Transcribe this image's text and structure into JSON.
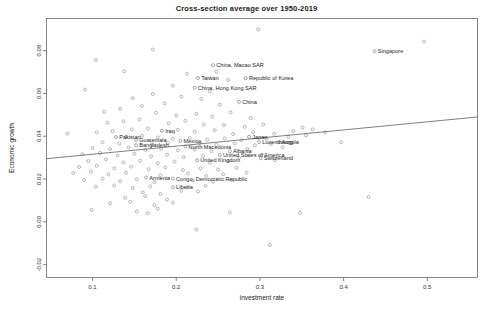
{
  "chart_data": {
    "type": "scatter",
    "title": "Cross-section average over 1950-2019",
    "xlabel": "investment rate",
    "ylabel": "Economic growth",
    "xlim": [
      0.045,
      0.56
    ],
    "ylim": [
      -0.026,
      0.095
    ],
    "xticks": [
      0.1,
      0.2,
      0.3,
      0.4,
      0.5
    ],
    "xtick_labels": [
      "0.1",
      "0.2",
      "0.3",
      "0.4",
      "0.5"
    ],
    "yticks": [
      -0.02,
      0.0,
      0.02,
      0.04,
      0.06,
      0.08
    ],
    "ytick_labels": [
      "-0.02",
      "0.00",
      "0.02",
      "0.04",
      "0.06",
      "0.08"
    ],
    "grid": false,
    "legend": "none",
    "fit_line": {
      "type": "linear-regression",
      "x_start": 0.045,
      "y_start": 0.0295,
      "x_end": 0.56,
      "y_end": 0.049
    },
    "labeled_points": [
      {
        "label": "Singapore",
        "x": 0.437,
        "y": 0.0797
      },
      {
        "label": "China, Macao SAR",
        "x": 0.244,
        "y": 0.0732
      },
      {
        "label": "Taiwan",
        "x": 0.226,
        "y": 0.0672
      },
      {
        "label": "Republic of Korea",
        "x": 0.283,
        "y": 0.0671
      },
      {
        "label": "China, Hong Kong SAR",
        "x": 0.222,
        "y": 0.0627
      },
      {
        "label": "China",
        "x": 0.275,
        "y": 0.0561
      },
      {
        "label": "Iraq",
        "x": 0.183,
        "y": 0.0425
      },
      {
        "label": "Pakistan",
        "x": 0.128,
        "y": 0.0396
      },
      {
        "label": "Guatemala",
        "x": 0.152,
        "y": 0.0383
      },
      {
        "label": "Mexico",
        "x": 0.205,
        "y": 0.0378
      },
      {
        "label": "Japan",
        "x": 0.287,
        "y": 0.0397
      },
      {
        "label": "Luxembourg",
        "x": 0.299,
        "y": 0.0372
      },
      {
        "label": "Angola",
        "x": 0.322,
        "y": 0.0372
      },
      {
        "label": "Bangladesh",
        "x": 0.152,
        "y": 0.0358
      },
      {
        "label": "North Macedonia",
        "x": 0.211,
        "y": 0.0352
      },
      {
        "label": "Albania",
        "x": 0.264,
        "y": 0.0329
      },
      {
        "label": "United States of America",
        "x": 0.252,
        "y": 0.0312
      },
      {
        "label": "Switzerland",
        "x": 0.301,
        "y": 0.0297
      },
      {
        "label": "United Kingdom",
        "x": 0.225,
        "y": 0.0288
      },
      {
        "label": "Armenia",
        "x": 0.164,
        "y": 0.0207
      },
      {
        "label": "Congo, Democratic Republic",
        "x": 0.196,
        "y": 0.0202
      },
      {
        "label": "Liberia",
        "x": 0.196,
        "y": 0.0161
      }
    ],
    "unlabeled_points": [
      {
        "x": 0.298,
        "y": 0.0899
      },
      {
        "x": 0.496,
        "y": 0.0842
      },
      {
        "x": 0.172,
        "y": 0.0805
      },
      {
        "x": 0.104,
        "y": 0.0756
      },
      {
        "x": 0.138,
        "y": 0.0703
      },
      {
        "x": 0.213,
        "y": 0.0692
      },
      {
        "x": 0.196,
        "y": 0.0636
      },
      {
        "x": 0.262,
        "y": 0.0663
      },
      {
        "x": 0.24,
        "y": 0.061
      },
      {
        "x": 0.172,
        "y": 0.0597
      },
      {
        "x": 0.148,
        "y": 0.0578
      },
      {
        "x": 0.206,
        "y": 0.0585
      },
      {
        "x": 0.23,
        "y": 0.0575
      },
      {
        "x": 0.252,
        "y": 0.0548
      },
      {
        "x": 0.186,
        "y": 0.0554
      },
      {
        "x": 0.159,
        "y": 0.0541
      },
      {
        "x": 0.133,
        "y": 0.0528
      },
      {
        "x": 0.114,
        "y": 0.0515
      },
      {
        "x": 0.176,
        "y": 0.051
      },
      {
        "x": 0.2,
        "y": 0.0497
      },
      {
        "x": 0.224,
        "y": 0.0505
      },
      {
        "x": 0.243,
        "y": 0.0492
      },
      {
        "x": 0.265,
        "y": 0.0512
      },
      {
        "x": 0.289,
        "y": 0.0485
      },
      {
        "x": 0.156,
        "y": 0.0478
      },
      {
        "x": 0.137,
        "y": 0.047
      },
      {
        "x": 0.118,
        "y": 0.0463
      },
      {
        "x": 0.191,
        "y": 0.046
      },
      {
        "x": 0.211,
        "y": 0.0472
      },
      {
        "x": 0.233,
        "y": 0.0455
      },
      {
        "x": 0.257,
        "y": 0.0452
      },
      {
        "x": 0.282,
        "y": 0.0444
      },
      {
        "x": 0.304,
        "y": 0.0455
      },
      {
        "x": 0.147,
        "y": 0.0432
      },
      {
        "x": 0.166,
        "y": 0.0436
      },
      {
        "x": 0.124,
        "y": 0.0424
      },
      {
        "x": 0.105,
        "y": 0.0418
      },
      {
        "x": 0.202,
        "y": 0.043
      },
      {
        "x": 0.222,
        "y": 0.0421
      },
      {
        "x": 0.246,
        "y": 0.0428
      },
      {
        "x": 0.268,
        "y": 0.041
      },
      {
        "x": 0.292,
        "y": 0.0419
      },
      {
        "x": 0.317,
        "y": 0.0412
      },
      {
        "x": 0.34,
        "y": 0.0424
      },
      {
        "x": 0.363,
        "y": 0.0432
      },
      {
        "x": 0.14,
        "y": 0.0398
      },
      {
        "x": 0.159,
        "y": 0.0402
      },
      {
        "x": 0.178,
        "y": 0.0394
      },
      {
        "x": 0.196,
        "y": 0.0388
      },
      {
        "x": 0.216,
        "y": 0.0392
      },
      {
        "x": 0.237,
        "y": 0.0384
      },
      {
        "x": 0.258,
        "y": 0.039
      },
      {
        "x": 0.278,
        "y": 0.0382
      },
      {
        "x": 0.308,
        "y": 0.0388
      },
      {
        "x": 0.334,
        "y": 0.0398
      },
      {
        "x": 0.355,
        "y": 0.0404
      },
      {
        "x": 0.378,
        "y": 0.0418
      },
      {
        "x": 0.112,
        "y": 0.0372
      },
      {
        "x": 0.132,
        "y": 0.0366
      },
      {
        "x": 0.171,
        "y": 0.0362
      },
      {
        "x": 0.19,
        "y": 0.037
      },
      {
        "x": 0.228,
        "y": 0.0368
      },
      {
        "x": 0.248,
        "y": 0.036
      },
      {
        "x": 0.27,
        "y": 0.0366
      },
      {
        "x": 0.294,
        "y": 0.0358
      },
      {
        "x": 0.313,
        "y": 0.0364
      },
      {
        "x": 0.1,
        "y": 0.0345
      },
      {
        "x": 0.121,
        "y": 0.034
      },
      {
        "x": 0.143,
        "y": 0.0348
      },
      {
        "x": 0.163,
        "y": 0.0336
      },
      {
        "x": 0.182,
        "y": 0.0342
      },
      {
        "x": 0.202,
        "y": 0.0334
      },
      {
        "x": 0.222,
        "y": 0.0338
      },
      {
        "x": 0.242,
        "y": 0.033
      },
      {
        "x": 0.285,
        "y": 0.034
      },
      {
        "x": 0.327,
        "y": 0.0348
      },
      {
        "x": 0.088,
        "y": 0.0316
      },
      {
        "x": 0.109,
        "y": 0.0322
      },
      {
        "x": 0.13,
        "y": 0.031
      },
      {
        "x": 0.15,
        "y": 0.0318
      },
      {
        "x": 0.17,
        "y": 0.0306
      },
      {
        "x": 0.189,
        "y": 0.0314
      },
      {
        "x": 0.209,
        "y": 0.0302
      },
      {
        "x": 0.232,
        "y": 0.0308
      },
      {
        "x": 0.275,
        "y": 0.03
      },
      {
        "x": 0.302,
        "y": 0.0312
      },
      {
        "x": 0.095,
        "y": 0.0284
      },
      {
        "x": 0.116,
        "y": 0.0292
      },
      {
        "x": 0.137,
        "y": 0.0278
      },
      {
        "x": 0.157,
        "y": 0.0286
      },
      {
        "x": 0.178,
        "y": 0.0274
      },
      {
        "x": 0.198,
        "y": 0.0282
      },
      {
        "x": 0.24,
        "y": 0.0276
      },
      {
        "x": 0.262,
        "y": 0.0284
      },
      {
        "x": 0.318,
        "y": 0.0288
      },
      {
        "x": 0.084,
        "y": 0.0256
      },
      {
        "x": 0.105,
        "y": 0.0262
      },
      {
        "x": 0.126,
        "y": 0.025
      },
      {
        "x": 0.146,
        "y": 0.0258
      },
      {
        "x": 0.167,
        "y": 0.0246
      },
      {
        "x": 0.187,
        "y": 0.0254
      },
      {
        "x": 0.208,
        "y": 0.0242
      },
      {
        "x": 0.229,
        "y": 0.025
      },
      {
        "x": 0.25,
        "y": 0.0244
      },
      {
        "x": 0.272,
        "y": 0.0252
      },
      {
        "x": 0.077,
        "y": 0.0228
      },
      {
        "x": 0.098,
        "y": 0.0234
      },
      {
        "x": 0.119,
        "y": 0.0222
      },
      {
        "x": 0.14,
        "y": 0.023
      },
      {
        "x": 0.181,
        "y": 0.0218
      },
      {
        "x": 0.214,
        "y": 0.0226
      },
      {
        "x": 0.236,
        "y": 0.0214
      },
      {
        "x": 0.256,
        "y": 0.0222
      },
      {
        "x": 0.284,
        "y": 0.023
      },
      {
        "x": 0.09,
        "y": 0.0196
      },
      {
        "x": 0.112,
        "y": 0.0202
      },
      {
        "x": 0.133,
        "y": 0.019
      },
      {
        "x": 0.153,
        "y": 0.0198
      },
      {
        "x": 0.174,
        "y": 0.0186
      },
      {
        "x": 0.22,
        "y": 0.0194
      },
      {
        "x": 0.244,
        "y": 0.0188
      },
      {
        "x": 0.266,
        "y": 0.0196
      },
      {
        "x": 0.104,
        "y": 0.0164
      },
      {
        "x": 0.126,
        "y": 0.017
      },
      {
        "x": 0.148,
        "y": 0.0158
      },
      {
        "x": 0.169,
        "y": 0.0166
      },
      {
        "x": 0.213,
        "y": 0.016
      },
      {
        "x": 0.235,
        "y": 0.0168
      },
      {
        "x": 0.206,
        "y": 0.0145
      },
      {
        "x": 0.16,
        "y": 0.0138
      },
      {
        "x": 0.181,
        "y": 0.013
      },
      {
        "x": 0.226,
        "y": 0.0142
      },
      {
        "x": 0.139,
        "y": 0.0112
      },
      {
        "x": 0.163,
        "y": 0.012
      },
      {
        "x": 0.189,
        "y": 0.0104
      },
      {
        "x": 0.121,
        "y": 0.0086
      },
      {
        "x": 0.145,
        "y": 0.0094
      },
      {
        "x": 0.174,
        "y": 0.0078
      },
      {
        "x": 0.196,
        "y": 0.009
      },
      {
        "x": 0.099,
        "y": 0.0056
      },
      {
        "x": 0.153,
        "y": 0.0048
      },
      {
        "x": 0.178,
        "y": 0.0062
      },
      {
        "x": 0.166,
        "y": 0.004
      },
      {
        "x": 0.348,
        "y": 0.0042
      },
      {
        "x": 0.43,
        "y": 0.0116
      },
      {
        "x": 0.397,
        "y": 0.0372
      },
      {
        "x": 0.351,
        "y": 0.044
      },
      {
        "x": 0.224,
        "y": -0.0036
      },
      {
        "x": 0.312,
        "y": -0.0108
      },
      {
        "x": 0.264,
        "y": 0.0044
      },
      {
        "x": 0.091,
        "y": 0.0618
      },
      {
        "x": 0.248,
        "y": 0.0702
      },
      {
        "x": 0.07,
        "y": 0.0412
      }
    ]
  }
}
